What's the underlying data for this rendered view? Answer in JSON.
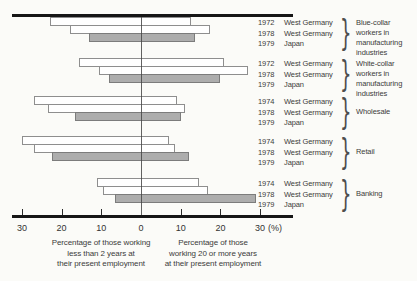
{
  "figure": {
    "background": "#fbfbf8"
  },
  "chart_data": {
    "type": "bar",
    "variant": "diverging-horizontal",
    "title": "",
    "unit": "(%)",
    "axis": {
      "tick_values": [
        30,
        20,
        10,
        0,
        10,
        20,
        30
      ],
      "tick_labels": [
        "30",
        "20",
        "10",
        "0",
        "10",
        "20",
        "30"
      ],
      "max_pct": 30,
      "left_caption_lines": [
        "Percentage of those working",
        "less than 2 years at",
        "their present employment"
      ],
      "right_caption_lines": [
        "Percentage of those",
        "working 20 or more years",
        "at their present employment"
      ]
    },
    "legend": {
      "west_germany_fill": "#ffffff",
      "japan_fill": "#adadad"
    },
    "groups": [
      {
        "label": "Blue-collar workers in manufacturing industries",
        "label_lines": [
          "Blue-collar",
          "workers in",
          "manufacturing",
          "industries"
        ],
        "rows": [
          {
            "year": "1972",
            "country": "West Germany",
            "left_pct": 23,
            "right_pct": 12.5,
            "fill": "white"
          },
          {
            "year": "1978",
            "country": "West Germany",
            "left_pct": 18,
            "right_pct": 17.5,
            "fill": "white"
          },
          {
            "year": "1979",
            "country": "Japan",
            "left_pct": 13,
            "right_pct": 13.5,
            "fill": "gray"
          }
        ]
      },
      {
        "label": "White-collar workers in manufacturing industries",
        "label_lines": [
          "White-collar",
          "workers in",
          "manufacturing",
          "industries"
        ],
        "rows": [
          {
            "year": "1972",
            "country": "West Germany",
            "left_pct": 15.5,
            "right_pct": 21,
            "fill": "white"
          },
          {
            "year": "1978",
            "country": "West Germany",
            "left_pct": 10.5,
            "right_pct": 27,
            "fill": "white"
          },
          {
            "year": "1979",
            "country": "Japan",
            "left_pct": 8,
            "right_pct": 20,
            "fill": "gray"
          }
        ]
      },
      {
        "label": "Wholesale",
        "label_lines": [
          "Wholesale"
        ],
        "rows": [
          {
            "year": "1974",
            "country": "West Germany",
            "left_pct": 27,
            "right_pct": 9,
            "fill": "white"
          },
          {
            "year": "1978",
            "country": "West Germany",
            "left_pct": 23.5,
            "right_pct": 11,
            "fill": "white"
          },
          {
            "year": "1979",
            "country": "Japan",
            "left_pct": 16.5,
            "right_pct": 10,
            "fill": "gray"
          }
        ]
      },
      {
        "label": "Retail",
        "label_lines": [
          "Retail"
        ],
        "rows": [
          {
            "year": "1974",
            "country": "West Germany",
            "left_pct": 30,
            "right_pct": 7,
            "fill": "white"
          },
          {
            "year": "1978",
            "country": "West Germany",
            "left_pct": 27,
            "right_pct": 8.5,
            "fill": "white"
          },
          {
            "year": "1979",
            "country": "Japan",
            "left_pct": 22.5,
            "right_pct": 12,
            "fill": "gray"
          }
        ]
      },
      {
        "label": "Banking",
        "label_lines": [
          "Banking"
        ],
        "rows": [
          {
            "year": "1974",
            "country": "West Germany",
            "left_pct": 11,
            "right_pct": 14.5,
            "fill": "white"
          },
          {
            "year": "1978",
            "country": "West Germany",
            "left_pct": 9.5,
            "right_pct": 17,
            "fill": "white"
          },
          {
            "year": "1979",
            "country": "Japan",
            "left_pct": 6.5,
            "right_pct": 29,
            "fill": "gray"
          }
        ]
      }
    ]
  }
}
